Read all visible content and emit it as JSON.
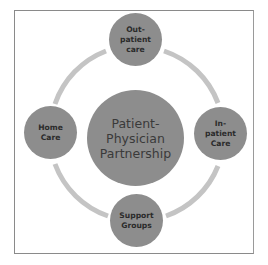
{
  "diagram": {
    "type": "cycle",
    "colors": {
      "node_fill": "#8d8d8d",
      "ring": "#c4c4c4",
      "frame": "#8a8a8a",
      "text": "#2b2b2b"
    },
    "center": {
      "label": "Patient-\nPhysician\nPartnership"
    },
    "nodes": [
      {
        "id": "top",
        "label": "Out-\npatient\ncare"
      },
      {
        "id": "right",
        "label": "In-\npatient\nCare"
      },
      {
        "id": "bottom",
        "label": "Support\nGroups"
      },
      {
        "id": "left",
        "label": "Home\nCare"
      }
    ]
  }
}
